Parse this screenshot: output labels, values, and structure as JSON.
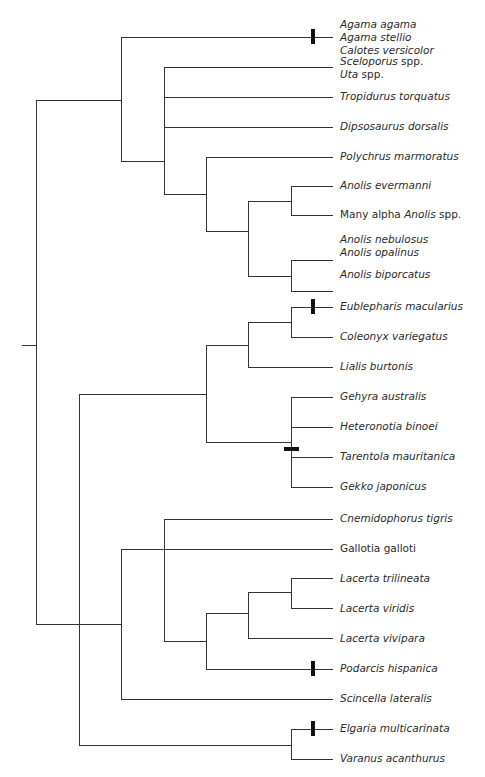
{
  "diagram": {
    "type": "phylogenetic-tree",
    "line_color": "#333333",
    "marker_color": "#111111",
    "taxa": [
      {
        "id": "agama",
        "lines": [
          {
            "parts": [
              {
                "t": "Agama agama",
                "i": true
              }
            ]
          },
          {
            "parts": [
              {
                "t": "Agama stellio",
                "i": true
              }
            ]
          },
          {
            "parts": [
              {
                "t": "Calotes versicolor",
                "i": true
              }
            ]
          }
        ],
        "y": 37,
        "marker": "vertical"
      },
      {
        "id": "sceloporus",
        "lines": [
          {
            "parts": [
              {
                "t": "Sceloporus",
                "i": true
              },
              {
                "t": " spp.",
                "i": false
              }
            ]
          },
          {
            "parts": [
              {
                "t": "Uta",
                "i": true
              },
              {
                "t": " spp.",
                "i": false
              }
            ]
          }
        ],
        "y": 67
      },
      {
        "id": "tropidurus",
        "lines": [
          {
            "parts": [
              {
                "t": "Tropidurus torquatus",
                "i": true
              }
            ]
          }
        ],
        "y": 97
      },
      {
        "id": "dipsosaurus",
        "lines": [
          {
            "parts": [
              {
                "t": "Dipsosaurus dorsalis",
                "i": true
              }
            ]
          }
        ],
        "y": 127
      },
      {
        "id": "polychrus",
        "lines": [
          {
            "parts": [
              {
                "t": "Polychrus marmoratus",
                "i": true
              }
            ]
          }
        ],
        "y": 157
      },
      {
        "id": "anolis-evermanni",
        "lines": [
          {
            "parts": [
              {
                "t": "Anolis evermanni",
                "i": true
              }
            ]
          }
        ],
        "y": 186
      },
      {
        "id": "alpha-anolis",
        "lines": [
          {
            "parts": [
              {
                "t": "Many alpha ",
                "i": false
              },
              {
                "t": "Anolis",
                "i": true
              },
              {
                "t": " spp.",
                "i": false
              }
            ]
          }
        ],
        "y": 215
      },
      {
        "id": "anolis-nebulosus",
        "lines": [
          {
            "parts": [
              {
                "t": "Anolis nebulosus",
                "i": true
              }
            ]
          },
          {
            "parts": [
              {
                "t": "Anolis opalinus",
                "i": true
              }
            ]
          }
        ],
        "y": 245
      },
      {
        "id": "anolis-biporcatus",
        "lines": [
          {
            "parts": [
              {
                "t": "Anolis biporcatus",
                "i": true
              }
            ]
          }
        ],
        "y": 275
      },
      {
        "id": "eublepharis",
        "lines": [
          {
            "parts": [
              {
                "t": "Eublepharis macularius",
                "i": true
              }
            ]
          }
        ],
        "y": 307,
        "marker": "vertical"
      },
      {
        "id": "coleonyx",
        "lines": [
          {
            "parts": [
              {
                "t": "Coleonyx variegatus",
                "i": true
              }
            ]
          }
        ],
        "y": 337
      },
      {
        "id": "lialis",
        "lines": [
          {
            "parts": [
              {
                "t": "Lialis burtonis",
                "i": true
              }
            ]
          }
        ],
        "y": 367
      },
      {
        "id": "gehyra",
        "lines": [
          {
            "parts": [
              {
                "t": "Gehyra australis",
                "i": true
              }
            ]
          }
        ],
        "y": 397
      },
      {
        "id": "heteronotia",
        "lines": [
          {
            "parts": [
              {
                "t": "Heteronotia binoei",
                "i": true
              }
            ]
          }
        ],
        "y": 427
      },
      {
        "id": "tarentola",
        "lines": [
          {
            "parts": [
              {
                "t": "Tarentola mauritanica",
                "i": true
              }
            ]
          }
        ],
        "y": 457
      },
      {
        "id": "gekko",
        "lines": [
          {
            "parts": [
              {
                "t": "Gekko japonicus",
                "i": true
              }
            ]
          }
        ],
        "y": 487
      },
      {
        "id": "cnemidophorus",
        "lines": [
          {
            "parts": [
              {
                "t": "Cnemidophorus tigris",
                "i": true
              }
            ]
          }
        ],
        "y": 519
      },
      {
        "id": "gallotia",
        "lines": [
          {
            "parts": [
              {
                "t": "Gallotia galloti",
                "i": false
              }
            ]
          }
        ],
        "y": 549
      },
      {
        "id": "lacerta-trilineata",
        "lines": [
          {
            "parts": [
              {
                "t": "Lacerta trilineata",
                "i": true
              }
            ]
          }
        ],
        "y": 579
      },
      {
        "id": "lacerta-viridis",
        "lines": [
          {
            "parts": [
              {
                "t": "Lacerta viridis",
                "i": true
              }
            ]
          }
        ],
        "y": 609
      },
      {
        "id": "lacerta-vivipara",
        "lines": [
          {
            "parts": [
              {
                "t": "Lacerta vivipara",
                "i": true
              }
            ]
          }
        ],
        "y": 639
      },
      {
        "id": "podarcis",
        "lines": [
          {
            "parts": [
              {
                "t": "Podarcis hispanica",
                "i": true
              }
            ]
          }
        ],
        "y": 669,
        "marker": "vertical"
      },
      {
        "id": "scincella",
        "lines": [
          {
            "parts": [
              {
                "t": "Scincella lateralis",
                "i": true
              }
            ]
          }
        ],
        "y": 699
      },
      {
        "id": "elgaria",
        "lines": [
          {
            "parts": [
              {
                "t": "Elgaria multicarinata",
                "i": true
              }
            ]
          }
        ],
        "y": 729,
        "marker": "vertical"
      },
      {
        "id": "varanus",
        "lines": [
          {
            "parts": [
              {
                "t": "Varanus acanthurus",
                "i": true
              }
            ]
          }
        ],
        "y": 759
      }
    ],
    "tip_x": 333,
    "segments": [
      [
        22,
        345,
        36,
        345
      ],
      [
        36,
        100,
        36,
        624
      ],
      [
        36,
        100,
        121,
        100
      ],
      [
        36,
        624,
        79,
        624
      ],
      [
        121,
        37,
        121,
        161
      ],
      [
        121,
        37,
        333,
        37
      ],
      [
        121,
        161,
        164,
        161
      ],
      [
        164,
        67,
        164,
        194
      ],
      [
        164,
        67,
        333,
        67
      ],
      [
        164,
        97,
        333,
        97
      ],
      [
        164,
        127,
        333,
        127
      ],
      [
        164,
        194,
        206,
        194
      ],
      [
        206,
        157,
        206,
        231
      ],
      [
        206,
        157,
        333,
        157
      ],
      [
        206,
        231,
        248,
        231
      ],
      [
        248,
        201,
        248,
        276
      ],
      [
        248,
        201,
        291,
        201
      ],
      [
        248,
        276,
        291,
        276
      ],
      [
        291,
        186,
        291,
        215
      ],
      [
        291,
        186,
        333,
        186
      ],
      [
        291,
        215,
        333,
        215
      ],
      [
        291,
        260,
        291,
        291
      ],
      [
        291,
        260,
        333,
        260
      ],
      [
        291,
        291,
        333,
        291
      ],
      [
        79,
        394,
        79,
        745
      ],
      [
        79,
        394,
        206,
        394
      ],
      [
        206,
        345,
        206,
        442
      ],
      [
        206,
        345,
        248,
        345
      ],
      [
        248,
        322,
        248,
        367
      ],
      [
        248,
        322,
        291,
        322
      ],
      [
        248,
        367,
        333,
        367
      ],
      [
        291,
        307,
        291,
        337
      ],
      [
        291,
        307,
        333,
        307
      ],
      [
        291,
        337,
        333,
        337
      ],
      [
        206,
        442,
        291,
        442
      ],
      [
        291,
        397,
        291,
        487
      ],
      [
        291,
        397,
        333,
        397
      ],
      [
        291,
        427,
        333,
        427
      ],
      [
        291,
        457,
        333,
        457
      ],
      [
        291,
        487,
        333,
        487
      ],
      [
        121,
        549,
        121,
        699
      ],
      [
        79,
        624,
        121,
        624
      ],
      [
        121,
        549,
        333,
        549
      ],
      [
        121,
        699,
        333,
        699
      ],
      [
        164,
        519,
        164,
        641
      ],
      [
        164,
        519,
        333,
        519
      ],
      [
        164,
        641,
        206,
        641
      ],
      [
        206,
        613,
        206,
        669
      ],
      [
        206,
        613,
        248,
        613
      ],
      [
        206,
        669,
        333,
        669
      ],
      [
        248,
        592,
        248,
        638
      ],
      [
        248,
        592,
        291,
        592
      ],
      [
        248,
        638,
        333,
        638
      ],
      [
        291,
        578,
        291,
        608
      ],
      [
        291,
        578,
        333,
        578
      ],
      [
        291,
        608,
        333,
        608
      ],
      [
        79,
        745,
        291,
        745
      ],
      [
        291,
        729,
        291,
        759
      ],
      [
        291,
        729,
        333,
        729
      ],
      [
        291,
        759,
        333,
        759
      ]
    ],
    "markers": [
      {
        "x": 313,
        "y": 37,
        "orient": "vertical"
      },
      {
        "x": 313,
        "y": 307,
        "orient": "vertical"
      },
      {
        "x": 291,
        "y": 449,
        "orient": "horizontal"
      },
      {
        "x": 313,
        "y": 669,
        "orient": "vertical"
      },
      {
        "x": 313,
        "y": 729,
        "orient": "vertical"
      }
    ]
  }
}
